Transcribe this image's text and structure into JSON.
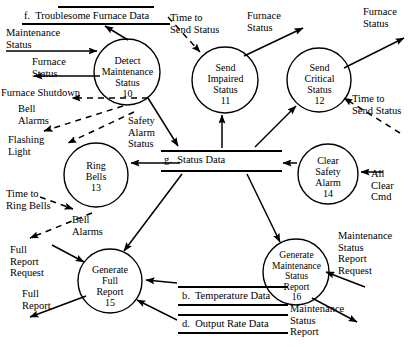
{
  "diagram": {
    "type": "data-flow-diagram",
    "stroke_color": "#000000",
    "background_color": "#ffffff"
  },
  "processes": [
    {
      "id": "10",
      "name": "Detect Maintenance Status",
      "line1": "Detect",
      "line2": "Maintenance",
      "line3": "Status",
      "number": "10",
      "cx": 127,
      "cy": 72,
      "r": 33
    },
    {
      "id": "11",
      "name": "Send Impaired Status",
      "line1": "Send",
      "line2": "Impaired",
      "line3": "Status",
      "number": "11",
      "cx": 225,
      "cy": 80,
      "r": 33
    },
    {
      "id": "12",
      "name": "Send Critical Status",
      "line1": "Send",
      "line2": "Critical",
      "line3": "Status",
      "number": "12",
      "cx": 319,
      "cy": 80,
      "r": 32
    },
    {
      "id": "13",
      "name": "Ring Bells",
      "line1": "Ring",
      "line2": "Bells",
      "line3": "",
      "number": "13",
      "cx": 96,
      "cy": 175,
      "r": 32
    },
    {
      "id": "14",
      "name": "Clear Safety Alarm",
      "line1": "Clear",
      "line2": "Safety",
      "line3": "Alarm",
      "number": "14",
      "cx": 328,
      "cy": 174,
      "r": 30
    },
    {
      "id": "15",
      "name": "Generate Full Report",
      "line1": "Generate",
      "line2": "Full",
      "line3": "Report",
      "number": "15",
      "cx": 110,
      "cy": 281,
      "r": 32
    },
    {
      "id": "16",
      "name": "Generate Maintenance Status Report",
      "line1": "Generate",
      "line2": "Maintenance",
      "line3": "Status",
      "line4": "Report",
      "number": "16",
      "cx": 296,
      "cy": 272,
      "r": 33
    }
  ],
  "data_stores": [
    {
      "id": "f",
      "label": "f.  Troublesome Furnace Data",
      "x": 22,
      "y": 6,
      "w": 148,
      "top_w": 96,
      "top_x": 58
    },
    {
      "id": "g",
      "label": "g.  Status Data",
      "x": 160,
      "y": 150,
      "w": 122,
      "top_w": 122,
      "top_x": 160
    },
    {
      "id": "b",
      "label": "b.  Temperature Data",
      "x": 178,
      "y": 286,
      "w": 110,
      "top_w": 110,
      "top_x": 178
    },
    {
      "id": "d",
      "label": "d.  Output Rate Data",
      "x": 178,
      "y": 314,
      "w": 110,
      "top_w": 110,
      "top_x": 178
    }
  ],
  "flow_labels": [
    {
      "name": "maintenance-status-in",
      "text": "Maintenance\nStatus",
      "x": 6,
      "y": 27
    },
    {
      "name": "furnace-status-out-left",
      "text": "Furnace\nStatus",
      "x": 32,
      "y": 58
    },
    {
      "name": "furnace-shutdown",
      "text": "Furnace Shutdown",
      "x": 1,
      "y": 89
    },
    {
      "name": "bell-alarms-left",
      "text": "Bell\nAlarms",
      "x": 18,
      "y": 105
    },
    {
      "name": "flashing-light",
      "text": "Flashing\nLight",
      "x": 8,
      "y": 136
    },
    {
      "name": "time-to-ring-bells",
      "text": "Time to\nRing Bells",
      "x": 6,
      "y": 190
    },
    {
      "name": "bell-alarms-lower",
      "text": "Bell\nAlarms",
      "x": 72,
      "y": 216
    },
    {
      "name": "full-report-request",
      "text": "Full\nReport\nRequest",
      "x": 10,
      "y": 246
    },
    {
      "name": "full-report-out",
      "text": "Full\nReport",
      "x": 22,
      "y": 289
    },
    {
      "name": "safety-alarm-status",
      "text": "Safety\nAlarm\nStatus",
      "x": 128,
      "y": 117
    },
    {
      "name": "time-to-send-status-left",
      "text": "Time to\nSend Status",
      "x": 170,
      "y": 14
    },
    {
      "name": "furnace-status-mid",
      "text": "Furnace\nStatus",
      "x": 247,
      "y": 12
    },
    {
      "name": "furnace-status-right",
      "text": "Furnace\nStatus",
      "x": 363,
      "y": 8
    },
    {
      "name": "time-to-send-status-right",
      "text": "Time to\nSend Status",
      "x": 352,
      "y": 95
    },
    {
      "name": "all-clear-cmd",
      "text": "All\nClear\nCmd",
      "x": 371,
      "y": 170
    },
    {
      "name": "maintenance-status-report-request",
      "text": "Maintenance\nStatus\nReport\nRequest",
      "x": 338,
      "y": 232
    },
    {
      "name": "maintenance-status-report-out",
      "text": "Maintenance\nStatus\nReport",
      "x": 290,
      "y": 305
    }
  ],
  "edges": [
    {
      "name": "flow-maintenance-status-to-p10",
      "style": "solid"
    },
    {
      "name": "flow-p10-to-furnace-status",
      "style": "solid"
    },
    {
      "name": "flow-p10-to-store-f",
      "style": "solid"
    },
    {
      "name": "flow-p10-furnace-shutdown",
      "style": "dashed"
    },
    {
      "name": "flow-p10-bell-alarms",
      "style": "dashed"
    },
    {
      "name": "flow-p10-flashing-light",
      "style": "dashed"
    },
    {
      "name": "flow-p10-to-store-g",
      "style": "solid"
    },
    {
      "name": "flow-time-to-send-status-to-p11",
      "style": "dashed"
    },
    {
      "name": "flow-p11-to-furnace-status",
      "style": "solid"
    },
    {
      "name": "flow-store-g-to-p11",
      "style": "solid"
    },
    {
      "name": "flow-p12-to-furnace-status",
      "style": "solid"
    },
    {
      "name": "flow-store-g-to-p12",
      "style": "solid"
    },
    {
      "name": "flow-time-to-send-status-to-p12",
      "style": "dashed"
    },
    {
      "name": "flow-store-g-to-p13",
      "style": "solid"
    },
    {
      "name": "flow-time-to-ring-bells-to-p13",
      "style": "dashed"
    },
    {
      "name": "flow-p13-bell-alarms",
      "style": "dashed"
    },
    {
      "name": "flow-p14-to-store-g",
      "style": "solid"
    },
    {
      "name": "flow-all-clear-cmd-to-p14",
      "style": "solid"
    },
    {
      "name": "flow-store-g-to-p15",
      "style": "solid"
    },
    {
      "name": "flow-full-report-request-to-p15",
      "style": "solid"
    },
    {
      "name": "flow-p15-full-report",
      "style": "solid"
    },
    {
      "name": "flow-store-b-to-p15",
      "style": "solid"
    },
    {
      "name": "flow-store-d-to-p15",
      "style": "solid"
    },
    {
      "name": "flow-store-g-to-p16",
      "style": "solid"
    },
    {
      "name": "flow-request-to-p16",
      "style": "solid"
    },
    {
      "name": "flow-p16-report-out",
      "style": "solid"
    }
  ]
}
